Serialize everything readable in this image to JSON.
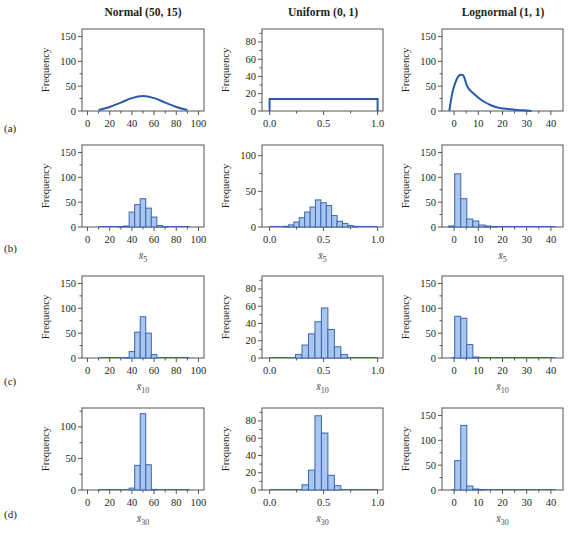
{
  "figure": {
    "column_titles": [
      "Normal (50, 15)",
      "Uniform (0, 1)",
      "Lognormal (1, 1)"
    ],
    "row_labels": [
      "(a)",
      "(b)",
      "(c)",
      "(d)"
    ],
    "ylabel": "Frequency",
    "colors": {
      "curve": "#2a5aa8",
      "bar_fill": "#a9c6ee",
      "bar_edge": "#3d66b0",
      "axis": "#555555"
    }
  },
  "chart_data": [
    {
      "type": "line",
      "row": "(a)",
      "title": "Normal (50, 15)",
      "xlabel": "",
      "ylabel": "Frequency",
      "xlim": [
        -5,
        105
      ],
      "ylim": [
        0,
        165
      ],
      "xticks": [
        0,
        20,
        40,
        60,
        80,
        100
      ],
      "yticks": [
        0,
        50,
        100,
        150
      ],
      "x": [
        10,
        20,
        30,
        40,
        50,
        60,
        70,
        80,
        90
      ],
      "y": [
        2,
        8,
        17,
        26,
        30,
        26,
        17,
        8,
        2
      ]
    },
    {
      "type": "line",
      "row": "(a)",
      "title": "Uniform (0, 1)",
      "xlabel": "",
      "ylabel": "Frequency",
      "xlim": [
        -0.07,
        1.05
      ],
      "ylim": [
        0,
        95
      ],
      "xticks": [
        0.0,
        0.5,
        1.0
      ],
      "xtick_labels": [
        "0.0",
        "0.5",
        "1.0"
      ],
      "yticks": [
        0,
        20,
        40,
        60,
        80
      ],
      "x": [
        0,
        0,
        1,
        1
      ],
      "y": [
        0,
        14,
        14,
        0
      ]
    },
    {
      "type": "line",
      "row": "(a)",
      "title": "Lognormal (1, 1)",
      "xlabel": "",
      "ylabel": "Frequency",
      "xlim": [
        -5,
        45
      ],
      "ylim": [
        0,
        165
      ],
      "xticks": [
        0,
        10,
        20,
        30,
        40
      ],
      "yticks": [
        0,
        50,
        100,
        150
      ],
      "x": [
        -2,
        -1,
        0,
        1,
        2,
        3,
        4,
        5,
        6,
        8,
        10,
        12,
        15,
        18,
        22,
        26,
        30,
        32
      ],
      "y": [
        0,
        30,
        50,
        63,
        71,
        73,
        70,
        55,
        45,
        35,
        27,
        20,
        12,
        7,
        4,
        2,
        1,
        0
      ]
    },
    {
      "type": "bar",
      "row": "(b)",
      "xlabel": "x̄5",
      "ylabel": "Frequency",
      "xlim": [
        -5,
        105
      ],
      "ylim": [
        0,
        165
      ],
      "xticks": [
        0,
        20,
        40,
        60,
        80,
        100
      ],
      "yticks": [
        0,
        50,
        100,
        150
      ],
      "bin_width": 5,
      "categories": [
        30,
        35,
        40,
        45,
        50,
        55,
        60,
        65,
        70
      ],
      "values": [
        1,
        2,
        30,
        45,
        57,
        38,
        20,
        3,
        1
      ]
    },
    {
      "type": "bar",
      "row": "(b)",
      "xlabel": "x̄5",
      "ylabel": "Frequency",
      "xlim": [
        -0.07,
        1.05
      ],
      "ylim": [
        0,
        115
      ],
      "xticks": [
        0.0,
        0.5,
        1.0
      ],
      "xtick_labels": [
        "0.0",
        "0.5",
        "1.0"
      ],
      "yticks": [
        0,
        50,
        100
      ],
      "bin_width": 0.05,
      "categories": [
        0.15,
        0.2,
        0.25,
        0.3,
        0.35,
        0.4,
        0.45,
        0.5,
        0.55,
        0.6,
        0.65,
        0.7,
        0.75,
        0.8,
        0.85
      ],
      "values": [
        1,
        3,
        7,
        13,
        21,
        28,
        38,
        34,
        30,
        16,
        8,
        5,
        2,
        1,
        0
      ]
    },
    {
      "type": "bar",
      "row": "(b)",
      "xlabel": "x̄5",
      "ylabel": "Frequency",
      "xlim": [
        -5,
        45
      ],
      "ylim": [
        0,
        165
      ],
      "xticks": [
        0,
        10,
        20,
        30,
        40
      ],
      "yticks": [
        0,
        50,
        100,
        150
      ],
      "bin_width": 2.5,
      "categories": [
        -1,
        1.5,
        4,
        6.5,
        9,
        11.5,
        14,
        16.5
      ],
      "values": [
        2,
        107,
        57,
        16,
        12,
        4,
        2,
        1
      ]
    },
    {
      "type": "bar",
      "row": "(c)",
      "xlabel": "x̄10",
      "ylabel": "Frequency",
      "xlim": [
        -5,
        105
      ],
      "ylim": [
        0,
        165
      ],
      "xticks": [
        0,
        20,
        40,
        60,
        80,
        100
      ],
      "yticks": [
        0,
        50,
        100,
        150
      ],
      "bin_width": 5,
      "categories": [
        35,
        40,
        45,
        50,
        55,
        60
      ],
      "values": [
        1,
        13,
        52,
        83,
        50,
        7
      ]
    },
    {
      "type": "bar",
      "row": "(c)",
      "xlabel": "x̄10",
      "ylabel": "Frequency",
      "xlim": [
        -0.07,
        1.05
      ],
      "ylim": [
        0,
        95
      ],
      "xticks": [
        0.0,
        0.5,
        1.0
      ],
      "xtick_labels": [
        "0.0",
        "0.5",
        "1.0"
      ],
      "yticks": [
        0,
        20,
        40,
        60,
        80
      ],
      "bin_width": 0.06,
      "categories": [
        0.27,
        0.33,
        0.39,
        0.45,
        0.51,
        0.57,
        0.63,
        0.69
      ],
      "values": [
        4,
        15,
        28,
        42,
        58,
        33,
        13,
        4
      ]
    },
    {
      "type": "bar",
      "row": "(c)",
      "xlabel": "x̄10",
      "ylabel": "Frequency",
      "xlim": [
        -5,
        45
      ],
      "ylim": [
        0,
        165
      ],
      "xticks": [
        0,
        10,
        20,
        30,
        40
      ],
      "yticks": [
        0,
        50,
        100,
        150
      ],
      "bin_width": 2.5,
      "categories": [
        1.5,
        4,
        6.5,
        9
      ],
      "values": [
        84,
        80,
        27,
        2
      ]
    },
    {
      "type": "bar",
      "row": "(d)",
      "xlabel": "x̄30",
      "ylabel": "Frequency",
      "xlim": [
        -5,
        105
      ],
      "ylim": [
        0,
        130
      ],
      "xticks": [
        0,
        20,
        40,
        60,
        80,
        100
      ],
      "yticks": [
        0,
        50,
        100
      ],
      "bin_width": 5,
      "categories": [
        40,
        45,
        50,
        55,
        60
      ],
      "values": [
        3,
        39,
        121,
        40,
        1
      ]
    },
    {
      "type": "bar",
      "row": "(d)",
      "xlabel": "x̄30",
      "ylabel": "Frequency",
      "xlim": [
        -0.07,
        1.05
      ],
      "ylim": [
        0,
        95
      ],
      "xticks": [
        0.0,
        0.5,
        1.0
      ],
      "xtick_labels": [
        "0.0",
        "0.5",
        "1.0"
      ],
      "yticks": [
        0,
        20,
        40,
        60,
        80
      ],
      "bin_width": 0.06,
      "categories": [
        0.33,
        0.39,
        0.45,
        0.51,
        0.57,
        0.63
      ],
      "values": [
        6,
        23,
        86,
        66,
        17,
        5
      ]
    },
    {
      "type": "bar",
      "row": "(d)",
      "xlabel": "x̄30",
      "ylabel": "Frequency",
      "xlim": [
        -5,
        45
      ],
      "ylim": [
        0,
        165
      ],
      "xticks": [
        0,
        10,
        20,
        30,
        40
      ],
      "yticks": [
        0,
        50,
        100,
        150
      ],
      "bin_width": 2.5,
      "categories": [
        1.5,
        4,
        6.5,
        9,
        11.5
      ],
      "values": [
        59,
        130,
        8,
        2,
        1
      ]
    }
  ]
}
